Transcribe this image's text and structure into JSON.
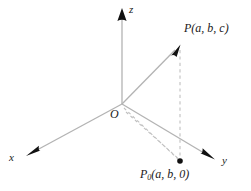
{
  "figure": {
    "background_color": "#ffffff",
    "line_color": "#b3b3b3",
    "dash_color": "#bdbdbd",
    "arrow_color": "#111111",
    "text_color": "#1a1a1a",
    "width": 251,
    "height": 191
  },
  "axes": {
    "x": {
      "label": "x",
      "arrow": "arrowhead-down-left"
    },
    "y": {
      "label": "y",
      "arrow": "arrowhead-down-right"
    },
    "z": {
      "label": "z",
      "arrow": "arrowhead-up"
    }
  },
  "origin": {
    "label": "O"
  },
  "points": {
    "p": {
      "name": "P",
      "label": "P(a, b, c)",
      "coordinates": "(a, b, c)",
      "marker": "vector-arrowhead"
    },
    "p0": {
      "name": "P0",
      "label_base": "P",
      "label_subscript": "0",
      "label_rest": "(a, b, 0)",
      "label": "P0(a, b, 0)",
      "coordinates": "(a, b, 0)",
      "marker": "filled-dot"
    }
  },
  "segments": {
    "vector_op": "solid line from O to P",
    "drop_line": "dashed vertical line from P to P0",
    "projection_lines": "dashed lines from O to P0"
  }
}
